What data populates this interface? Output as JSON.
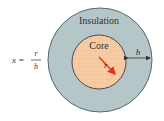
{
  "diagram": {
    "outer_label": "Insulation",
    "inner_label": "Core",
    "radius_label": "r",
    "thickness_label": "h",
    "formula": {
      "lhs": "x =",
      "numerator": "r",
      "denominator": "h"
    },
    "colors": {
      "insulation": "#b5c6c8",
      "core": "#f6c9a0",
      "radius_arrow": "#e0321e",
      "outline": "#4a4a4a"
    }
  }
}
